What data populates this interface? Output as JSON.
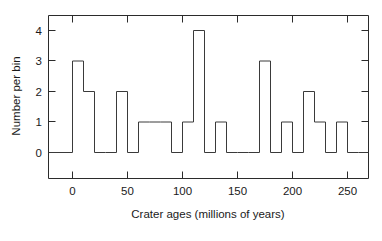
{
  "chart_data": {
    "type": "bar",
    "title": "",
    "subtitle": "",
    "xlabel": "Crater ages (millions of years)",
    "ylabel": "Number per bin",
    "xlim": [
      -20,
      275
    ],
    "ylim": [
      -0.55,
      4.6
    ],
    "xticks": [
      0,
      50,
      100,
      150,
      200,
      250
    ],
    "xtick_labels": [
      "0",
      "50",
      "100",
      "150",
      "200",
      "250"
    ],
    "yticks": [
      0,
      1,
      2,
      3,
      4
    ],
    "ytick_labels": [
      "0",
      "1",
      "2",
      "3",
      "4"
    ],
    "grid": false,
    "legend": null,
    "bin_width": 10,
    "bin_edges": [
      0,
      10,
      20,
      30,
      40,
      50,
      60,
      70,
      80,
      90,
      100,
      110,
      120,
      130,
      140,
      150,
      160,
      170,
      180,
      190,
      200,
      210,
      220,
      230,
      240,
      250,
      260
    ],
    "categories": [
      "0-10",
      "10-20",
      "20-30",
      "30-40",
      "40-50",
      "50-60",
      "60-70",
      "70-80",
      "80-90",
      "90-100",
      "100-110",
      "110-120",
      "120-130",
      "130-140",
      "140-150",
      "150-160",
      "160-170",
      "170-180",
      "180-190",
      "190-200",
      "200-210",
      "210-220",
      "220-230",
      "230-240",
      "240-250",
      "250-260"
    ],
    "values": [
      3,
      2,
      0,
      0,
      2,
      0,
      1,
      1,
      1,
      0,
      1,
      4,
      0,
      1,
      0,
      0,
      0,
      3,
      0,
      1,
      0,
      2,
      1,
      0,
      1,
      0
    ],
    "annotations": []
  },
  "axes": {
    "x_title": "Crater ages (millions of years)",
    "y_title": "Number per bin"
  }
}
